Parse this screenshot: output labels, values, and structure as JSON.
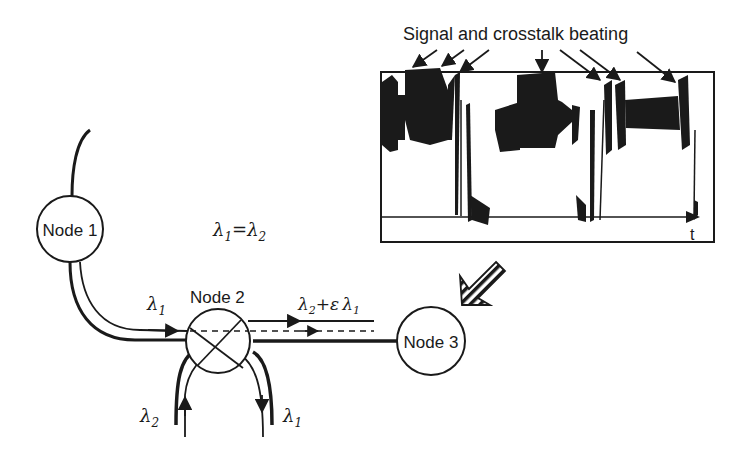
{
  "diagram": {
    "title_annotation": "Signal and crosstalk beating",
    "nodes": [
      {
        "id": "node1",
        "label": "Node 1"
      },
      {
        "id": "node2",
        "label": "Node 2"
      },
      {
        "id": "node3",
        "label": "Node 3"
      }
    ],
    "equation": {
      "lhs": "λ",
      "lhs_sub": "1",
      "eq": "=",
      "rhs": "λ",
      "rhs_sub": "2"
    },
    "labels": {
      "input_lambda": {
        "sym": "λ",
        "sub": "1"
      },
      "add_lambda": {
        "sym": "λ",
        "sub": "2"
      },
      "drop_lambda": {
        "sym": "λ",
        "sub": "1"
      },
      "output": {
        "sym": "λ",
        "sub": "2",
        "plus": "+",
        "eps": "ε",
        "sym2": "λ",
        "sub2": "1"
      }
    },
    "scope": {
      "time_axis_label": "t",
      "beating_arrows_count": 7
    }
  }
}
